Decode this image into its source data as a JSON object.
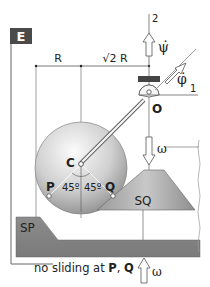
{
  "panel": {
    "tag": "E",
    "tag_bg": "#4a4a4a",
    "tag_fg": "#ffffff"
  },
  "dimensions": {
    "r_label": "R",
    "sqrt2r_label": "√2 R"
  },
  "axes": {
    "axis2_label": "2",
    "axis1_label": "1"
  },
  "rates": {
    "psi_dot": "ψ̇",
    "phi_dot": "φ̇",
    "omega_top": "ω",
    "omega_bottom": "ω"
  },
  "points": {
    "center": "C",
    "pivot": "O",
    "contact_p": "P",
    "contact_q": "Q"
  },
  "angles": {
    "left": "45º",
    "right": "45º"
  },
  "bodies": {
    "left_support": "SP",
    "right_support": "SQ"
  },
  "caption": {
    "prefix": "no sliding at ",
    "p": "P",
    "sep": ", ",
    "q": "Q"
  },
  "colors": {
    "support_fill": "#8a8a8a",
    "cone_fill": "#a8a8a8",
    "sphere_light": "#f4f4f4",
    "sphere_dark": "#8c8c8c",
    "line": "#555555",
    "bearing": "#444444"
  }
}
